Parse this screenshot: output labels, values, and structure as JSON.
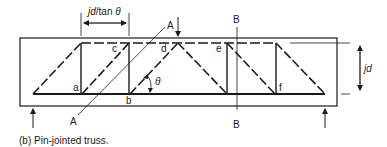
{
  "figure": {
    "caption": "(b)  Pin-jointed truss.",
    "dimensions": {
      "panel_width_label_italic": "jd",
      "panel_width_label_rest": "/tan ",
      "panel_width_label_theta": "θ",
      "depth_label": "jd"
    },
    "section_lines": {
      "A_top": "A",
      "A_bottom": "A",
      "B_top": "B",
      "B_bottom": "B"
    },
    "nodes": {
      "a": "a",
      "b": "b",
      "c": "c",
      "d": "d",
      "e": "e",
      "f": "f"
    },
    "angle_label": "θ",
    "colors": {
      "line": "#1a1a1a",
      "background": "#ffffff"
    }
  }
}
